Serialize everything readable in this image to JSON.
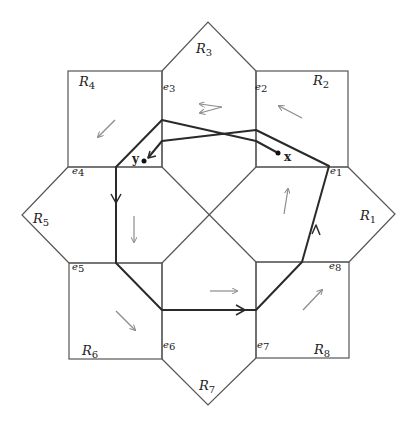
{
  "diagram": {
    "type": "octagonal-region-partition",
    "colors": {
      "outline": "#555555",
      "path": "#2a2a2a",
      "flow_arrow": "#8a8a8a",
      "background": "#ffffff"
    },
    "regions": [
      {
        "id": "R1",
        "base": "R",
        "sub": "1"
      },
      {
        "id": "R2",
        "base": "R",
        "sub": "2"
      },
      {
        "id": "R3",
        "base": "R",
        "sub": "3"
      },
      {
        "id": "R4",
        "base": "R",
        "sub": "4"
      },
      {
        "id": "R5",
        "base": "R",
        "sub": "5"
      },
      {
        "id": "R6",
        "base": "R",
        "sub": "6"
      },
      {
        "id": "R7",
        "base": "R",
        "sub": "7"
      },
      {
        "id": "R8",
        "base": "R",
        "sub": "8"
      }
    ],
    "edges": [
      {
        "id": "e1",
        "base": "e",
        "sub": "1"
      },
      {
        "id": "e2",
        "base": "e",
        "sub": "2"
      },
      {
        "id": "e3",
        "base": "e",
        "sub": "3"
      },
      {
        "id": "e4",
        "base": "e",
        "sub": "4"
      },
      {
        "id": "e5",
        "base": "e",
        "sub": "5"
      },
      {
        "id": "e6",
        "base": "e",
        "sub": "6"
      },
      {
        "id": "e7",
        "base": "e",
        "sub": "7"
      },
      {
        "id": "e8",
        "base": "e",
        "sub": "8"
      }
    ],
    "points": {
      "x": "x",
      "y": "y"
    }
  }
}
